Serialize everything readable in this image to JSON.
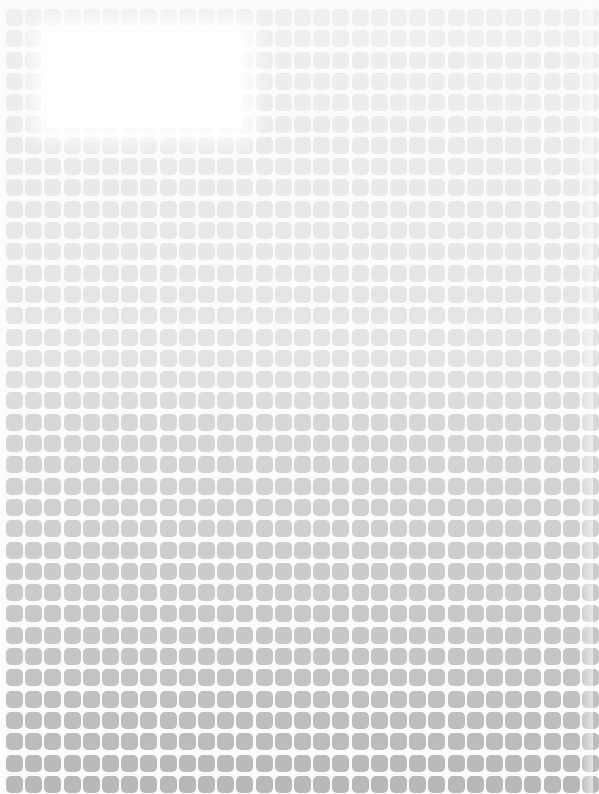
{
  "pattern": {
    "description": "Grid of rounded gray squares on white background, darkening from top to bottom, with a white faded patch near the top-left",
    "columns": 31,
    "rows": 37,
    "tile_color_stops": [
      {
        "at": 0.0,
        "color": "#efefef"
      },
      {
        "at": 0.45,
        "color": "#e3e3e3"
      },
      {
        "at": 0.53,
        "color": "#d6d6d6"
      },
      {
        "at": 0.8,
        "color": "#c6c6c6"
      },
      {
        "at": 1.0,
        "color": "#b6b6b6"
      }
    ],
    "background_color": "#fbfbfb",
    "overlay_color": "#ffffff"
  }
}
